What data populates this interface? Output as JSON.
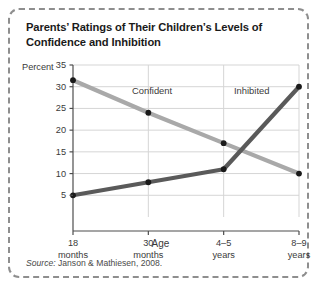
{
  "figure": {
    "title": "Parents’ Ratings of Their Children’s Levels of Confidence and Inhibition",
    "source_label": "Source:",
    "source_text": " Janson & Mathiesen, 2008."
  },
  "chart_data": {
    "type": "line",
    "title": "Parents’ Ratings of Their Children’s Levels of Confidence and Inhibition",
    "xlabel": "Age",
    "ylabel": "Percent",
    "categories": [
      "18 months",
      "30 months",
      "4–5 years",
      "8–9 years"
    ],
    "category_lines": [
      [
        "18",
        "months"
      ],
      [
        "30",
        "months"
      ],
      [
        "4–5",
        "years"
      ],
      [
        "8–9",
        "years"
      ]
    ],
    "series": [
      {
        "name": "Confident",
        "values": [
          31.5,
          24,
          17,
          10
        ],
        "color": "#a9a9a9",
        "marker_color": "#1a1a1a"
      },
      {
        "name": "Inhibited",
        "values": [
          5,
          8,
          11,
          30
        ],
        "color": "#5a5a5a",
        "marker_color": "#1a1a1a"
      }
    ],
    "ylim": [
      0,
      35
    ],
    "yticks": [
      5,
      10,
      15,
      20,
      25,
      30,
      35
    ],
    "ytick_labels": [
      "5",
      "10",
      "15",
      "20",
      "25",
      "30",
      "35"
    ],
    "grid": "horizontal-and-vertical",
    "legend_position": "inline-labels",
    "axis_color": "#4d4d4d",
    "grid_color": "#d5d5d5",
    "border_color": "#8e8e8e",
    "background": "#ffffff"
  }
}
